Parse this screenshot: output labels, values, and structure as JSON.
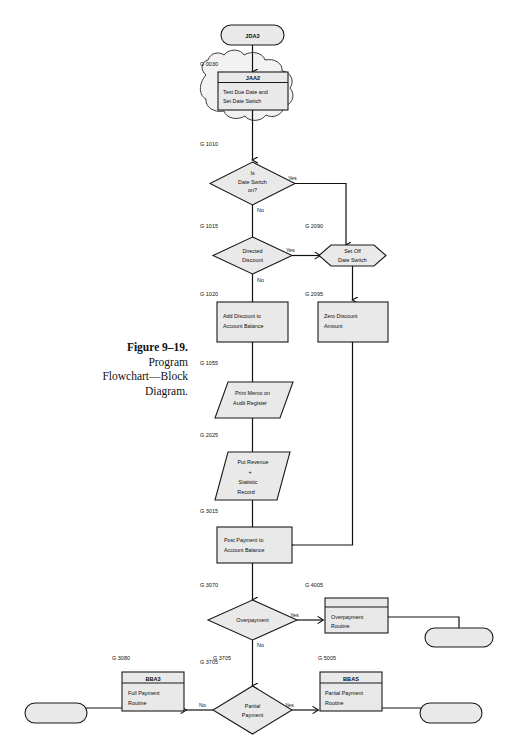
{
  "figure": {
    "number_label": "Figure 9–19.",
    "title_line1": "Program",
    "title_line2": "Flowchart—Block",
    "title_line3": "Diagram."
  },
  "colors": {
    "shape_fill": "#e9e9e9",
    "stroke": "#111111",
    "cloud_fill": "#f2f2f2",
    "page_background": "#ffffff"
  },
  "nodes": {
    "start_terminator": {
      "text": "JDA3",
      "shape": "terminator"
    },
    "jaa2_module": {
      "header": "JAA2",
      "body_line1": "Test Due Date and",
      "body_line2": "Set Date Switch",
      "shape": "predefined-process"
    },
    "date_switch_decision": {
      "line1": "Is",
      "line2": "Date Switch",
      "line3": "on?",
      "shape": "decision"
    },
    "directed_discount_decision": {
      "line1": "Directed",
      "line2": "Discount",
      "shape": "decision"
    },
    "set_off_date_switch": {
      "line1": "Set Off",
      "line2": "Date Switch",
      "shape": "preparation"
    },
    "add_discount": {
      "line1": "Add Discount to",
      "line2": "Account Balance",
      "shape": "process"
    },
    "zero_discount": {
      "line1": "Zero Discount",
      "line2": "Amount",
      "shape": "process"
    },
    "print_memo": {
      "line1": "Print Memo on",
      "line2": "Audit Register",
      "shape": "document-io"
    },
    "put_revenue": {
      "line1": "Put Revenue",
      "line2": "+",
      "line3": "Statistic",
      "line4": "Record",
      "shape": "document-io"
    },
    "post_payment": {
      "line1": "Post Payment to",
      "line2": "Account  Balance",
      "shape": "process"
    },
    "overpayment_decision": {
      "line1": "Overpayment",
      "shape": "decision"
    },
    "overpayment_routine": {
      "line1": "Overpayment",
      "line2": "Routine",
      "shape": "predefined-process"
    },
    "partial_payment_decision": {
      "line1": "Partial",
      "line2": "Payment",
      "shape": "decision"
    },
    "full_payment_routine": {
      "header": "BBA3",
      "line1": "Full Payment",
      "line2": "Routine",
      "shape": "predefined-process"
    },
    "partial_payment_routine": {
      "header": "BBAS",
      "line1": "Partial Payment",
      "line2": "Routine",
      "shape": "predefined-process"
    },
    "end_terminator_right_top": {
      "text": "",
      "shape": "terminator"
    },
    "end_terminator_left": {
      "text": "",
      "shape": "terminator"
    },
    "end_terminator_right": {
      "text": "",
      "shape": "terminator"
    }
  },
  "step_refs": {
    "g0030": "G 0030",
    "g1010": "G 1010",
    "g1015": "G 1015",
    "g1020": "G 1020",
    "g1055": "G 1055",
    "g2025": "G 2025",
    "g2090": "G 2090",
    "g2095": "G 2095",
    "g3015": "G 3015",
    "g3070": "G 3070",
    "g3080": "G 3080",
    "g3705": "G 3705",
    "g4005": "G 4005",
    "g5005": "G 5005"
  },
  "branch_labels": {
    "date_switch_yes": "Yes",
    "date_switch_no": "No",
    "directed_discount_yes": "Yes",
    "directed_discount_no": "No",
    "overpayment_yes": "Yes",
    "overpayment_no": "No",
    "partial_payment_yes": "Yes",
    "partial_payment_no": "No"
  }
}
